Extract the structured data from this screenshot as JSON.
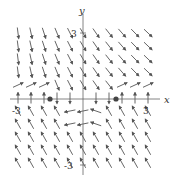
{
  "chart_data": {
    "type": "vector_field",
    "title": "",
    "xlabel": "x",
    "ylabel": "y",
    "xlim": [
      -3,
      3
    ],
    "ylim": [
      -3,
      3
    ],
    "x_ticks": [
      "-3",
      "3"
    ],
    "y_ticks": [
      "3",
      "-3"
    ],
    "equilibrium_points": [
      [
        -1.5,
        0
      ],
      [
        1.5,
        0
      ]
    ]
  },
  "labels": {
    "x_axis": "x",
    "y_axis": "y",
    "x_neg": "-3",
    "x_pos": "3",
    "y_pos": "3",
    "y_neg": "-3"
  },
  "colors": {
    "axis": "#555555",
    "arrow": "#555555",
    "dot": "#444444"
  }
}
